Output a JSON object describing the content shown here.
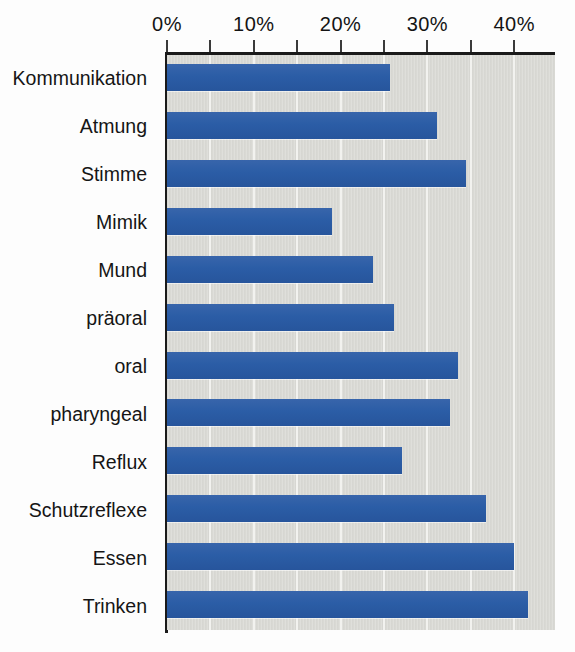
{
  "chart_data": {
    "type": "bar",
    "orientation": "horizontal",
    "title": "",
    "subtitle": "",
    "xlabel": "",
    "ylabel": "",
    "xlim": [
      0,
      44.7
    ],
    "xticks": [
      0,
      5,
      10,
      15,
      20,
      25,
      30,
      35,
      40
    ],
    "xtick_labels": [
      "0%",
      "",
      "10%",
      "",
      "20%",
      "",
      "30%",
      "",
      "40%"
    ],
    "grid": true,
    "grid_axis": "x",
    "legend": null,
    "categories": [
      "Kommunikation",
      "Atmung",
      "Stimme",
      "Mimik",
      "Mund",
      "präoral",
      "oral",
      "pharyngeal",
      "Reflux",
      "Schutzreflexe",
      "Essen",
      "Trinken"
    ],
    "values": [
      25.7,
      31.1,
      34.4,
      19.0,
      23.7,
      26.2,
      33.5,
      32.6,
      27.1,
      36.7,
      40.0,
      41.6
    ],
    "unit": "%",
    "series": [
      {
        "name": "Anteil",
        "color": "#2b5da6",
        "values": [
          25.7,
          31.1,
          34.4,
          19.0,
          23.7,
          26.2,
          33.5,
          32.6,
          27.1,
          36.7,
          40.0,
          41.6
        ]
      }
    ]
  },
  "style": {
    "bar_color": "#2b5da6",
    "plot_background": "#d9d9d4",
    "grid_color": "#f2f2ef",
    "axis_color": "#1a1a1a",
    "text_color": "#151515",
    "page_background": "#fdfdfd"
  }
}
